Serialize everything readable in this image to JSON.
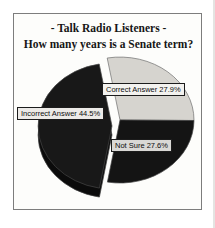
{
  "title": {
    "line1": "- Talk Radio Listeners -",
    "line2": "How many years is a Senate term?"
  },
  "chart_data": {
    "type": "pie",
    "title": "- Talk Radio Listeners - How many years is a Senate term?",
    "start_angle_deg": -10,
    "direction": "clockwise",
    "legend_position": "none",
    "labels_style": "boxed-callouts",
    "style": "3d-exploded",
    "slices": [
      {
        "label": "Correct Answer",
        "value": 27.9,
        "display": "Correct Answer 27.9%",
        "color": "#d6d4cf",
        "exploded": false
      },
      {
        "label": "Not Sure",
        "value": 27.6,
        "display": "Not Sure 27.6%",
        "color": "#141414",
        "exploded": false
      },
      {
        "label": "Incorrect Answer",
        "value": 44.5,
        "display": "Incorrect Answer 44.5%",
        "color": "#181818",
        "exploded": true
      }
    ]
  },
  "colors": {
    "frame_border": "#7d7d7d",
    "label_box_border": "#1c1c1c",
    "pie_rim": "#0b0b0b",
    "background": "#fdfdfb"
  }
}
